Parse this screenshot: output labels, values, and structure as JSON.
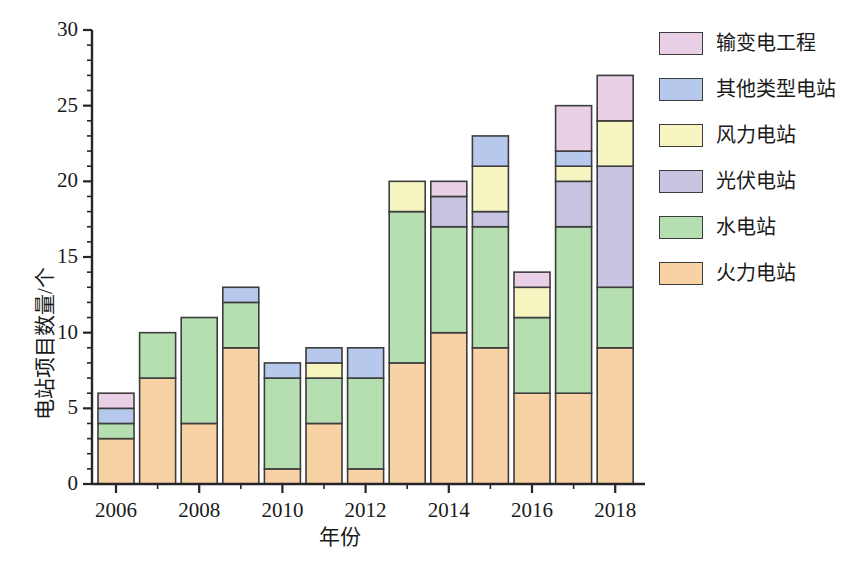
{
  "chart_data": {
    "type": "bar",
    "stacked": true,
    "title": "",
    "xlabel": "年份",
    "ylabel": "电站项目数量/个",
    "categories": [
      "2006",
      "2007",
      "2008",
      "2009",
      "2010",
      "2011",
      "2012",
      "2013",
      "2014",
      "2015",
      "2016",
      "2017",
      "2018"
    ],
    "xtick_labels": [
      "2006",
      "2008",
      "2010",
      "2012",
      "2014",
      "2016",
      "2018"
    ],
    "ytick_labels": [
      "0",
      "5",
      "10",
      "15",
      "20",
      "25",
      "30"
    ],
    "yticks": [
      0,
      5,
      10,
      15,
      20,
      25,
      30
    ],
    "ylim": [
      0,
      30
    ],
    "grid": false,
    "legend_position": "right",
    "series": [
      {
        "name": "火力电站",
        "color": "#f8d2a4",
        "values": [
          3,
          7,
          4,
          9,
          1,
          4,
          1,
          8,
          10,
          9,
          6,
          6,
          9
        ]
      },
      {
        "name": "水电站",
        "color": "#b6dfb1",
        "values": [
          1,
          3,
          7,
          3,
          6,
          3,
          6,
          10,
          7,
          8,
          5,
          11,
          4
        ]
      },
      {
        "name": "光伏电站",
        "color": "#c7c5e2",
        "values": [
          0,
          0,
          0,
          0,
          0,
          0,
          0,
          0,
          2,
          1,
          0,
          3,
          8
        ]
      },
      {
        "name": "风力电站",
        "color": "#f6f5c2",
        "values": [
          0,
          0,
          0,
          0,
          0,
          1,
          0,
          2,
          0,
          3,
          2,
          1,
          3
        ]
      },
      {
        "name": "其他类型电站",
        "color": "#b6c9ec",
        "values": [
          1,
          0,
          0,
          1,
          1,
          1,
          2,
          0,
          0,
          2,
          0,
          1,
          0
        ]
      },
      {
        "name": "输变电工程",
        "color": "#ead0e6",
        "values": [
          1,
          0,
          0,
          0,
          0,
          0,
          0,
          0,
          1,
          0,
          1,
          3,
          3
        ]
      }
    ],
    "totals": [
      6,
      10,
      11,
      13,
      8,
      9,
      9,
      20,
      20,
      23,
      14,
      25,
      27
    ],
    "legend_order": [
      "输变电工程",
      "其他类型电站",
      "风力电站",
      "光伏电站",
      "水电站",
      "火力电站"
    ],
    "legend": [
      {
        "label": "输变电工程",
        "color": "#ead0e6"
      },
      {
        "label": "其他类型电站",
        "color": "#b6c9ec"
      },
      {
        "label": "风力电站",
        "color": "#f6f5c2"
      },
      {
        "label": "光伏电站",
        "color": "#c7c5e2"
      },
      {
        "label": "水电站",
        "color": "#b6dfb1"
      },
      {
        "label": "火力电站",
        "color": "#f8d2a4"
      }
    ],
    "axis_color": "#262626",
    "bar_edge_color": "#3d3d3d",
    "background": "#ffffff"
  }
}
